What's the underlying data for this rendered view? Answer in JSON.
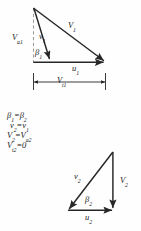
{
  "figure": {
    "upper_triangle": {
      "labels": {
        "relative_velocity": "V",
        "relative_velocity_sub": "1",
        "axial_velocity": "V",
        "axial_velocity_sub": "a1",
        "blade_relative": "v",
        "blade_relative_sub": "1",
        "angle": "β",
        "angle_sub": "1",
        "blade_speed": "u",
        "blade_speed_sub": "1",
        "tangential": "V",
        "tangential_sub": "t1"
      }
    },
    "equations": [
      {
        "lhs": "β",
        "lhs_sub": "1",
        "op": "=",
        "rhs": "β",
        "rhs_sub": "2",
        "text": "β₁ = β₂"
      },
      {
        "lhs": "v",
        "lhs_sub": "2",
        "op": "=",
        "rhs": "v",
        "rhs_sub": "1",
        "text": "v₂ = v₁"
      },
      {
        "lhs": "V",
        "lhs_sub": "2",
        "op": "=",
        "rhs": "V",
        "rhs_sub": "a2",
        "text": "V₂ = Vₐ₂"
      },
      {
        "lhs": "V",
        "lhs_sub": "t2",
        "op": "=",
        "rhs": "0",
        "rhs_sub": "",
        "text": "Vₜ₂ = 0"
      }
    ],
    "lower_triangle": {
      "labels": {
        "blade_relative": "v",
        "blade_relative_sub": "2",
        "absolute_velocity": "V",
        "absolute_velocity_sub": "2",
        "angle": "β",
        "angle_sub": "2",
        "blade_speed": "u",
        "blade_speed_sub": "2"
      }
    },
    "colors": {
      "ink": "#1a1a1a",
      "vector": "#262626",
      "dashed": "#8a8a8a",
      "background": "#fefefe"
    }
  }
}
